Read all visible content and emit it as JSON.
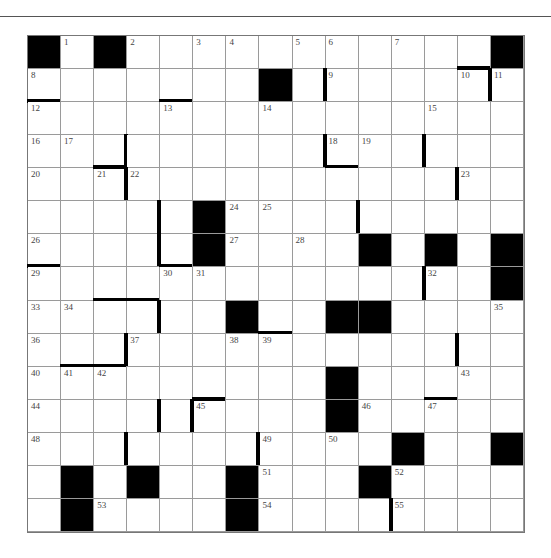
{
  "puzzle": {
    "size": 15,
    "rows": [
      [
        "#",
        "1",
        "#",
        "2",
        "",
        "3",
        "4",
        "",
        "5",
        "6",
        "",
        "7",
        "",
        "",
        "#"
      ],
      [
        "8",
        "",
        "",
        "",
        "",
        "",
        "",
        "#",
        "",
        "9",
        "",
        "",
        "",
        "10",
        "11"
      ],
      [
        "12",
        "",
        "",
        "",
        "13",
        "",
        "",
        "14",
        "",
        "",
        "",
        "",
        "15",
        "",
        ""
      ],
      [
        "16",
        "17",
        "",
        "",
        "",
        "",
        "",
        "",
        "",
        "18",
        "19",
        "",
        "",
        "",
        ""
      ],
      [
        "20",
        "",
        "21",
        "22",
        "",
        "",
        "",
        "",
        "",
        "",
        "",
        "",
        "",
        "23",
        ""
      ],
      [
        "",
        "",
        "",
        "",
        "",
        "#",
        "24",
        "25",
        "",
        "",
        "",
        "",
        "",
        "",
        ""
      ],
      [
        "26",
        "",
        "",
        "",
        "",
        "#",
        "27",
        "",
        "28",
        "",
        "#",
        "",
        "#",
        "",
        "#"
      ],
      [
        "29",
        "",
        "",
        "",
        "30",
        "31",
        "",
        "",
        "",
        "",
        "",
        "",
        "32",
        "",
        "#"
      ],
      [
        "33",
        "34",
        "",
        "",
        "",
        "",
        "#",
        "",
        "",
        "#",
        "#",
        "",
        "",
        "",
        "35"
      ],
      [
        "36",
        "",
        "",
        "37",
        "",
        "",
        "38",
        "39",
        "",
        "",
        "",
        "",
        "",
        "",
        ""
      ],
      [
        "40",
        "41",
        "42",
        "",
        "",
        "",
        "",
        "",
        "",
        "#",
        "",
        "",
        "",
        "43",
        ""
      ],
      [
        "44",
        "",
        "",
        "",
        "",
        "45",
        "",
        "",
        "",
        "#",
        "46",
        "",
        "47",
        "",
        ""
      ],
      [
        "48",
        "",
        "",
        "",
        "",
        "",
        "",
        "49",
        "",
        "50",
        "",
        "#",
        "",
        "",
        "#"
      ],
      [
        "",
        "#",
        "",
        "#",
        "",
        "",
        "#",
        "51",
        "",
        "",
        "#",
        "52",
        "",
        "",
        ""
      ],
      [
        "",
        "#",
        "53",
        "",
        "",
        "",
        "#",
        "54",
        "",
        "",
        "",
        "55",
        "",
        "",
        ""
      ]
    ],
    "bars": [
      {
        "r": 1,
        "c": 0,
        "side": "b"
      },
      {
        "r": 1,
        "c": 4,
        "side": "b"
      },
      {
        "r": 1,
        "c": 13,
        "side": "t"
      },
      {
        "r": 1,
        "c": 14,
        "side": "l"
      },
      {
        "r": 1,
        "c": 9,
        "side": "l"
      },
      {
        "r": 3,
        "c": 2,
        "side": "r"
      },
      {
        "r": 4,
        "c": 2,
        "side": "t"
      },
      {
        "r": 4,
        "c": 3,
        "side": "l"
      },
      {
        "r": 3,
        "c": 9,
        "side": "l"
      },
      {
        "r": 3,
        "c": 9,
        "side": "b"
      },
      {
        "r": 3,
        "c": 12,
        "side": "l"
      },
      {
        "r": 4,
        "c": 13,
        "side": "l"
      },
      {
        "r": 5,
        "c": 4,
        "side": "l"
      },
      {
        "r": 6,
        "c": 4,
        "side": "l"
      },
      {
        "r": 6,
        "c": 4,
        "side": "b"
      },
      {
        "r": 5,
        "c": 10,
        "side": "l"
      },
      {
        "r": 6,
        "c": 0,
        "side": "b"
      },
      {
        "r": 7,
        "c": 12,
        "side": "l"
      },
      {
        "r": 7,
        "c": 2,
        "side": "b"
      },
      {
        "r": 7,
        "c": 3,
        "side": "b"
      },
      {
        "r": 8,
        "c": 4,
        "side": "l"
      },
      {
        "r": 8,
        "c": 7,
        "side": "b"
      },
      {
        "r": 9,
        "c": 3,
        "side": "l"
      },
      {
        "r": 9,
        "c": 1,
        "side": "b"
      },
      {
        "r": 9,
        "c": 2,
        "side": "b"
      },
      {
        "r": 9,
        "c": 13,
        "side": "l"
      },
      {
        "r": 11,
        "c": 4,
        "side": "l"
      },
      {
        "r": 11,
        "c": 5,
        "side": "l"
      },
      {
        "r": 11,
        "c": 5,
        "side": "t"
      },
      {
        "r": 10,
        "c": 12,
        "side": "b"
      },
      {
        "r": 12,
        "c": 3,
        "side": "l"
      },
      {
        "r": 12,
        "c": 7,
        "side": "l"
      },
      {
        "r": 14,
        "c": 11,
        "side": "l"
      }
    ]
  }
}
